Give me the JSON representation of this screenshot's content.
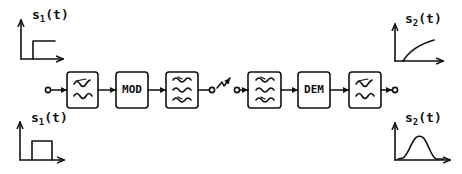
{
  "diagram": {
    "type": "signal-chain",
    "stroke_color": "#111111",
    "background": "#ffffff",
    "chain": [
      {
        "id": "input-terminal",
        "kind": "terminal"
      },
      {
        "id": "lowpass-filter-1",
        "kind": "block",
        "symbol": "lowpass",
        "label": ""
      },
      {
        "id": "modulator",
        "kind": "block",
        "label": "MOD"
      },
      {
        "id": "bandpass-filter-1",
        "kind": "block",
        "symbol": "bandpass",
        "label": ""
      },
      {
        "id": "tx-terminal",
        "kind": "terminal"
      },
      {
        "id": "radio-link",
        "kind": "antenna-arrow"
      },
      {
        "id": "rx-terminal",
        "kind": "terminal"
      },
      {
        "id": "bandpass-filter-2",
        "kind": "block",
        "symbol": "bandpass",
        "label": ""
      },
      {
        "id": "demodulator",
        "kind": "block",
        "label": "DEM"
      },
      {
        "id": "lowpass-filter-2",
        "kind": "block",
        "symbol": "lowpass",
        "label": ""
      },
      {
        "id": "output-terminal",
        "kind": "terminal"
      }
    ],
    "graphs": {
      "input_top": {
        "label_main": "s",
        "label_sub": "1",
        "label_arg": "(t)",
        "waveform": "step"
      },
      "input_bottom": {
        "label_main": "s",
        "label_sub": "1",
        "label_arg": "(t)",
        "waveform": "rectangular-pulse"
      },
      "output_top": {
        "label_main": "s",
        "label_sub": "2",
        "label_arg": "(t)",
        "waveform": "rising-exponential"
      },
      "output_bottom": {
        "label_main": "s",
        "label_sub": "2",
        "label_arg": "(t)",
        "waveform": "smoothed-pulse"
      }
    },
    "block_labels": {
      "mod": "MOD",
      "dem": "DEM"
    }
  }
}
